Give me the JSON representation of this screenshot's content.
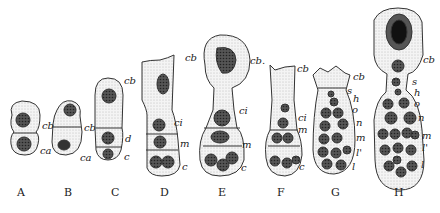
{
  "figure": {
    "stages": [
      {
        "id": "A",
        "caption": "A",
        "labels": [
          "cb",
          "ca"
        ]
      },
      {
        "id": "B",
        "caption": "B",
        "labels": [
          "cb",
          "ca"
        ]
      },
      {
        "id": "C",
        "caption": "C",
        "labels": [
          "cb",
          "d",
          "c"
        ]
      },
      {
        "id": "D",
        "caption": "D",
        "labels": [
          "cb",
          "ci",
          "m",
          "c"
        ]
      },
      {
        "id": "E",
        "caption": "E",
        "labels": [
          "cb.",
          "ci",
          "m",
          "c"
        ]
      },
      {
        "id": "F",
        "caption": "F",
        "labels": [
          "cb",
          "ci",
          "m",
          "c"
        ]
      },
      {
        "id": "G",
        "caption": "G",
        "labels": [
          "cb",
          "s",
          "h",
          "o",
          "n",
          "m",
          "l'",
          "l"
        ]
      },
      {
        "id": "H",
        "caption": "H",
        "labels": [
          "cb",
          "s",
          "h",
          "o",
          "n",
          "m",
          "l'",
          "l"
        ]
      }
    ]
  }
}
